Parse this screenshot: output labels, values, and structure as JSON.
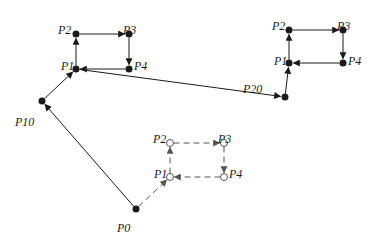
{
  "diagram": {
    "type": "path-traversal",
    "colors": {
      "solid": "#1a1a1a",
      "dashed": "#555555",
      "background": "#ffffff"
    },
    "nodes": [
      {
        "id": "A_P2",
        "label": "P2",
        "x": 76,
        "y": 34,
        "style": "filled",
        "lx": 58,
        "ly": 24
      },
      {
        "id": "A_P3",
        "label": "P3",
        "x": 129,
        "y": 34,
        "style": "filled",
        "lx": 123,
        "ly": 24
      },
      {
        "id": "A_P1",
        "label": "P1",
        "x": 76,
        "y": 69,
        "style": "filled",
        "lx": 61,
        "ly": 60
      },
      {
        "id": "A_P4",
        "label": "P4",
        "x": 129,
        "y": 69,
        "style": "filled",
        "lx": 134,
        "ly": 60
      },
      {
        "id": "P10",
        "label": "P10",
        "x": 42,
        "y": 101,
        "style": "filled",
        "lx": 15,
        "ly": 116
      },
      {
        "id": "P20",
        "label": "P20",
        "x": 285,
        "y": 97,
        "style": "filled",
        "lx": 243,
        "ly": 83
      },
      {
        "id": "B_P2",
        "label": "P2",
        "x": 289,
        "y": 30,
        "style": "filled",
        "lx": 272,
        "ly": 20
      },
      {
        "id": "B_P3",
        "label": "P3",
        "x": 343,
        "y": 30,
        "style": "filled",
        "lx": 337,
        "ly": 20
      },
      {
        "id": "B_P1",
        "label": "P1",
        "x": 289,
        "y": 63,
        "style": "filled",
        "lx": 274,
        "ly": 55
      },
      {
        "id": "B_P4",
        "label": "P4",
        "x": 343,
        "y": 63,
        "style": "filled",
        "lx": 348,
        "ly": 55
      },
      {
        "id": "P0",
        "label": "P0",
        "x": 136,
        "y": 209,
        "style": "filled",
        "lx": 117,
        "ly": 222
      },
      {
        "id": "C_P2",
        "label": "P2",
        "x": 170,
        "y": 143,
        "style": "open",
        "lx": 153,
        "ly": 133
      },
      {
        "id": "C_P3",
        "label": "P3",
        "x": 224,
        "y": 143,
        "style": "open",
        "lx": 218,
        "ly": 133
      },
      {
        "id": "C_P1",
        "label": "P1",
        "x": 170,
        "y": 177,
        "style": "open",
        "lx": 154,
        "ly": 168
      },
      {
        "id": "C_P4",
        "label": "P4",
        "x": 224,
        "y": 177,
        "style": "open",
        "lx": 229,
        "ly": 168
      }
    ],
    "edges": [
      {
        "from": "P0",
        "to": "P10",
        "style": "solid"
      },
      {
        "from": "P10",
        "to": "A_P1",
        "style": "solid"
      },
      {
        "from": "A_P1",
        "to": "A_P2",
        "style": "solid"
      },
      {
        "from": "A_P2",
        "to": "A_P3",
        "style": "solid"
      },
      {
        "from": "A_P3",
        "to": "A_P4",
        "style": "solid"
      },
      {
        "from": "A_P4",
        "to": "A_P1",
        "style": "solid"
      },
      {
        "from": "A_P1",
        "to": "P20",
        "style": "solid"
      },
      {
        "from": "P20",
        "to": "B_P1",
        "style": "solid"
      },
      {
        "from": "B_P1",
        "to": "B_P2",
        "style": "solid"
      },
      {
        "from": "B_P2",
        "to": "B_P3",
        "style": "solid"
      },
      {
        "from": "B_P3",
        "to": "B_P4",
        "style": "solid"
      },
      {
        "from": "B_P4",
        "to": "B_P1",
        "style": "solid"
      },
      {
        "from": "P0",
        "to": "C_P1",
        "style": "dashed"
      },
      {
        "from": "C_P1",
        "to": "C_P2",
        "style": "dashed"
      },
      {
        "from": "C_P2",
        "to": "C_P3",
        "style": "dashed"
      },
      {
        "from": "C_P3",
        "to": "C_P4",
        "style": "dashed"
      },
      {
        "from": "C_P4",
        "to": "C_P1",
        "style": "dashed"
      }
    ]
  }
}
